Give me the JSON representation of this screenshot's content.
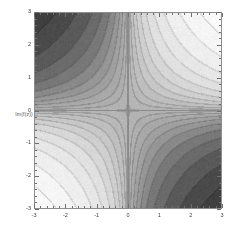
{
  "figure": {
    "type": "contour-density-plot",
    "background_color": "#ffffff",
    "frame_color": "#8d8d8d"
  },
  "axes": {
    "y_label": "Im(f(z))",
    "x_label": "",
    "x_ticks": [
      "-3",
      "-2",
      "-1",
      "0",
      "1",
      "2",
      "3"
    ],
    "y_ticks": [
      "3",
      "2",
      "1",
      "0",
      "-1",
      "-2",
      "-3"
    ],
    "x_tick_values": [
      -3,
      -2,
      -1,
      0,
      1,
      2,
      3
    ],
    "y_tick_values": [
      3,
      2,
      1,
      0,
      -1,
      -2,
      -3
    ],
    "minor_ticks_per_interval": 5,
    "frame_on_all_sides": true
  },
  "chart_data": {
    "type": "heatmap",
    "title": "",
    "xlabel": "",
    "ylabel": "Im(f(z))",
    "xlim": [
      -3,
      3
    ],
    "ylim": [
      -3,
      3
    ],
    "grid": false,
    "legend": "none",
    "colormap": "grayscale",
    "function": "f(x,y) = x*y  (saddle / hyperbolic level sets)",
    "contour_levels": [
      -9,
      -7,
      -5,
      -3.5,
      -2.5,
      -1.75,
      -1.2,
      -0.8,
      -0.5,
      -0.25,
      -0.1,
      0,
      0.1,
      0.25,
      0.5,
      0.8,
      1.2,
      1.75,
      2.5,
      3.5,
      5,
      7,
      9
    ],
    "value_range": [
      -9,
      9
    ],
    "saddle_point": [
      0,
      0
    ],
    "dark_quadrants": [
      "upper-left",
      "lower-right"
    ],
    "light_quadrants": [
      "upper-right",
      "lower-left"
    ],
    "grayscale_stops": [
      {
        "value": -9,
        "color": "#3a3a3a"
      },
      {
        "value": -6,
        "color": "#4a4a4a"
      },
      {
        "value": -4,
        "color": "#5c5c5c"
      },
      {
        "value": -2,
        "color": "#7a7a7a"
      },
      {
        "value": -0.8,
        "color": "#9c9c9c"
      },
      {
        "value": 0,
        "color": "#b4b4b4"
      },
      {
        "value": 0.8,
        "color": "#cccccc"
      },
      {
        "value": 2,
        "color": "#e0e0e0"
      },
      {
        "value": 4,
        "color": "#eeeeee"
      },
      {
        "value": 6,
        "color": "#f6f6f6"
      },
      {
        "value": 9,
        "color": "#fcfcfc"
      }
    ],
    "x_samples": [
      -3,
      -2.5,
      -2,
      -1.5,
      -1,
      -0.5,
      0,
      0.5,
      1,
      1.5,
      2,
      2.5,
      3
    ],
    "y_samples": [
      3,
      2.5,
      2,
      1.5,
      1,
      0.5,
      0,
      -0.5,
      -1,
      -1.5,
      -2,
      -2.5,
      -3
    ],
    "z_matrix": [
      [
        -9.0,
        -7.5,
        -6.0,
        -4.5,
        -3.0,
        -1.5,
        0.0,
        1.5,
        3.0,
        4.5,
        6.0,
        7.5,
        9.0
      ],
      [
        -7.5,
        -6.25,
        -5.0,
        -3.75,
        -2.5,
        -1.25,
        0.0,
        1.25,
        2.5,
        3.75,
        5.0,
        6.25,
        7.5
      ],
      [
        -6.0,
        -5.0,
        -4.0,
        -3.0,
        -2.0,
        -1.0,
        0.0,
        1.0,
        2.0,
        3.0,
        4.0,
        5.0,
        6.0
      ],
      [
        -4.5,
        -3.75,
        -3.0,
        -2.25,
        -1.5,
        -0.75,
        0.0,
        0.75,
        1.5,
        2.25,
        3.0,
        3.75,
        4.5
      ],
      [
        -3.0,
        -2.5,
        -2.0,
        -1.5,
        -1.0,
        -0.5,
        0.0,
        0.5,
        1.0,
        1.5,
        2.0,
        2.5,
        3.0
      ],
      [
        -1.5,
        -1.25,
        -1.0,
        -0.75,
        -0.5,
        -0.25,
        0.0,
        0.25,
        0.5,
        0.75,
        1.0,
        1.25,
        1.5
      ],
      [
        0.0,
        0.0,
        0.0,
        0.0,
        0.0,
        0.0,
        0.0,
        0.0,
        0.0,
        0.0,
        0.0,
        0.0,
        0.0
      ],
      [
        1.5,
        1.25,
        1.0,
        0.75,
        0.5,
        0.25,
        0.0,
        -0.25,
        -0.5,
        -0.75,
        -1.0,
        -1.25,
        -1.5
      ],
      [
        3.0,
        2.5,
        2.0,
        1.5,
        1.0,
        0.5,
        0.0,
        -0.5,
        -1.0,
        -1.5,
        -2.0,
        -2.5,
        -3.0
      ],
      [
        4.5,
        3.75,
        3.0,
        2.25,
        1.5,
        0.75,
        0.0,
        -0.75,
        -1.5,
        -2.25,
        -3.0,
        -3.75,
        -4.5
      ],
      [
        6.0,
        5.0,
        4.0,
        3.0,
        2.0,
        1.0,
        0.0,
        -1.0,
        -2.0,
        -3.0,
        -4.0,
        -5.0,
        -6.0
      ],
      [
        7.5,
        6.25,
        5.0,
        3.75,
        2.5,
        1.25,
        0.0,
        -1.25,
        -2.5,
        -3.75,
        -5.0,
        -6.25,
        -7.5
      ],
      [
        9.0,
        7.5,
        6.0,
        4.5,
        3.0,
        1.5,
        0.0,
        -1.5,
        -3.0,
        -4.5,
        -6.0,
        -7.5,
        -9.0
      ]
    ]
  }
}
